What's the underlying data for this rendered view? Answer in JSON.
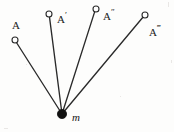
{
  "figure": {
    "background_color": "#fdfdfc",
    "stroke_color": "#262626",
    "pivot_fill_color": "#111111",
    "node_fill_color": "#ffffff",
    "width": 174,
    "height": 132,
    "pivot": {
      "label": "m",
      "x": 62,
      "y": 114,
      "radius": 4.5
    },
    "nodes": [
      {
        "id": "node-a",
        "base_label": "A",
        "primes": "",
        "full_label": "A",
        "marker_x": 15,
        "marker_y": 40,
        "marker_radius": 3,
        "label_x": 12,
        "label_y": 17
      },
      {
        "id": "node-a-prime",
        "base_label": "A",
        "primes": "′",
        "full_label": "A′",
        "marker_x": 49,
        "marker_y": 14,
        "marker_radius": 3,
        "label_x": 57,
        "label_y": 11
      },
      {
        "id": "node-a-double-prime",
        "base_label": "A",
        "primes": "″",
        "full_label": "A″",
        "marker_x": 96,
        "marker_y": 9,
        "marker_radius": 3,
        "label_x": 103,
        "label_y": 8
      },
      {
        "id": "node-a-triple-prime",
        "base_label": "A",
        "primes": "‴",
        "full_label": "A‴",
        "marker_x": 145,
        "marker_y": 15,
        "marker_radius": 3,
        "label_x": 149,
        "label_y": 24
      }
    ]
  }
}
